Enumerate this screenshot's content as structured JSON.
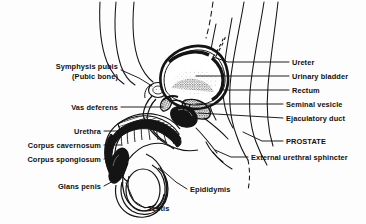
{
  "figure": {
    "type": "anatomical-line-diagram",
    "ink_color": "#111111",
    "background_color": "#fdfdfd"
  },
  "labels": {
    "left": [
      {
        "id": "symphysis-pubis",
        "line1": "Symphysis pubis",
        "line2": "(Pubic bone)",
        "text_x": 118,
        "text_y": 72,
        "leader": [
          [
            121,
            70
          ],
          [
            139,
            78
          ],
          [
            152,
            86
          ]
        ]
      },
      {
        "id": "vas-deferens",
        "line1": "Vas deferens",
        "line2": "",
        "text_x": 118,
        "text_y": 107,
        "leader": [
          [
            121,
            107
          ],
          [
            163,
            107
          ]
        ]
      },
      {
        "id": "urethra",
        "line1": "Urethra",
        "line2": "",
        "text_x": 101,
        "text_y": 131,
        "leader": [
          [
            104,
            131
          ],
          [
            118,
            131
          ]
        ]
      },
      {
        "id": "corpus-cavernosum",
        "line1": "Corpus cavernosum",
        "line2": "",
        "text_x": 101,
        "text_y": 145,
        "leader": [
          [
            104,
            145
          ],
          [
            121,
            145
          ]
        ]
      },
      {
        "id": "corpus-spongiosum",
        "line1": "Corpus spongiosum",
        "line2": "",
        "text_x": 101,
        "text_y": 159,
        "leader": [
          [
            104,
            159
          ],
          [
            118,
            155
          ]
        ]
      },
      {
        "id": "glans-penis",
        "line1": "Glans penis",
        "line2": "",
        "text_x": 101,
        "text_y": 186,
        "leader": [
          [
            104,
            186
          ],
          [
            117,
            179
          ]
        ]
      }
    ],
    "right": [
      {
        "id": "ureter",
        "line1": "Ureter",
        "text_x": 292,
        "text_y": 62,
        "leader": [
          [
            289,
            62
          ],
          [
            228,
            62
          ],
          [
            213,
            57
          ]
        ]
      },
      {
        "id": "urinary-bladder",
        "line1": "Urinary bladder",
        "text_x": 292,
        "text_y": 76,
        "leader": [
          [
            289,
            76
          ],
          [
            196,
            76
          ]
        ]
      },
      {
        "id": "rectum",
        "line1": "Rectum",
        "text_x": 292,
        "text_y": 90,
        "leader": [
          [
            289,
            90
          ],
          [
            222,
            90
          ]
        ]
      },
      {
        "id": "seminal-vesicle",
        "line1": "Seminal vesicle",
        "text_x": 286,
        "text_y": 104,
        "leader": [
          [
            283,
            104
          ],
          [
            196,
            104
          ]
        ]
      },
      {
        "id": "ejaculatory-duct",
        "line1": "Ejaculatory duct",
        "text_x": 286,
        "text_y": 118,
        "leader": [
          [
            283,
            118
          ],
          [
            198,
            113
          ]
        ]
      },
      {
        "id": "prostate",
        "line1": "PROSTATE",
        "text_x": 286,
        "text_y": 141,
        "leader": [
          [
            283,
            141
          ],
          [
            262,
            141
          ],
          [
            243,
            132
          ]
        ]
      },
      {
        "id": "external-urethral-sphincter",
        "line1": "External urethral sphincter",
        "text_x": 251,
        "text_y": 157,
        "leader": [
          [
            248,
            157
          ],
          [
            231,
            157
          ],
          [
            215,
            150
          ]
        ]
      }
    ],
    "bottom": [
      {
        "id": "epididymis",
        "line1": "Epididymis",
        "text_x": 190,
        "text_y": 189,
        "leader": [
          [
            187,
            189
          ],
          [
            176,
            182
          ],
          [
            160,
            168
          ]
        ]
      },
      {
        "id": "testis",
        "line1": "Testis",
        "text_x": 148,
        "text_y": 208,
        "leader": [
          [
            145,
            208
          ],
          [
            134,
            201
          ],
          [
            126,
            183
          ]
        ]
      }
    ]
  }
}
